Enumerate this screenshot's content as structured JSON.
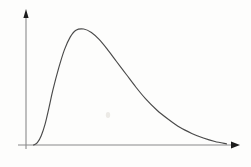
{
  "figure": {
    "title": "",
    "background_color": "#fdfdfc",
    "width": 251,
    "height": 167
  },
  "axes": {
    "origin": {
      "x": 26,
      "y": 145
    },
    "x_axis": {
      "name": "horizontal-axis",
      "label": "",
      "tick_labels": [],
      "start_x": 18,
      "end_x": 232,
      "y": 145,
      "arrowhead": true,
      "color": "#8a8a8a"
    },
    "y_axis": {
      "name": "vertical-axis",
      "label": "",
      "tick_labels": [],
      "x": 26,
      "start_y": 149,
      "end_y": 17,
      "arrowhead": true,
      "color": "#8a8a8a"
    },
    "arrow_color": "#1c1c1c"
  },
  "chart_data": {
    "type": "line",
    "title": "",
    "subtitle": "",
    "xlabel": "",
    "ylabel": "",
    "legend": [],
    "legend_position": "none",
    "grid": false,
    "xlim": [
      0,
      1
    ],
    "ylim": [
      0,
      1
    ],
    "x_tick_labels": [],
    "y_tick_labels": [],
    "annotations": [],
    "curve_color": "#4a4a4a",
    "curve_width": 1.15,
    "peak": {
      "x": 0.26,
      "y": 1.0
    },
    "series": [
      {
        "name": "distribution",
        "x": [
          0.0,
          0.02,
          0.04,
          0.06,
          0.08,
          0.1,
          0.13,
          0.16,
          0.19,
          0.22,
          0.26,
          0.3,
          0.34,
          0.38,
          0.43,
          0.48,
          0.53,
          0.58,
          0.64,
          0.7,
          0.76,
          0.82,
          0.88,
          0.94,
          1.0
        ],
        "y": [
          0.0,
          0.02,
          0.08,
          0.18,
          0.32,
          0.47,
          0.66,
          0.82,
          0.93,
          0.99,
          1.0,
          0.97,
          0.91,
          0.83,
          0.72,
          0.61,
          0.5,
          0.4,
          0.3,
          0.22,
          0.15,
          0.1,
          0.06,
          0.03,
          0.01
        ]
      }
    ]
  },
  "icons": {
    "x_arrow": "arrow-right-icon",
    "y_arrow": "arrow-up-icon"
  }
}
